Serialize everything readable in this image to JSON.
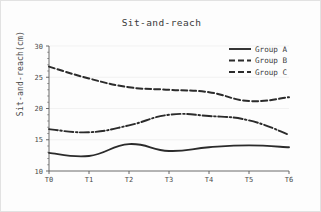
{
  "chart_data": {
    "type": "line",
    "title": "Sit-and-reach",
    "xlabel": "",
    "ylabel": "Sit-and-reach(cm)",
    "categories": [
      "T0",
      "T1",
      "T2",
      "T3",
      "T4",
      "T5",
      "T6"
    ],
    "ylim": [
      10,
      30
    ],
    "yticks": [
      10,
      15,
      20,
      25,
      30
    ],
    "grid": false,
    "legend_position": "top-right",
    "series": [
      {
        "name": "Group A",
        "style": "solid",
        "color": "#2b2b2b",
        "values": [
          12.9,
          12.4,
          14.3,
          13.2,
          13.8,
          14.1,
          13.8
        ]
      },
      {
        "name": "Group B",
        "style": "dash-dot",
        "color": "#2b2b2b",
        "values": [
          16.7,
          16.2,
          17.3,
          19.0,
          18.8,
          18.1,
          15.8
        ]
      },
      {
        "name": "Group C",
        "style": "dashed",
        "color": "#2b2b2b",
        "values": [
          26.7,
          24.8,
          23.4,
          23.0,
          22.6,
          21.2,
          21.8
        ]
      }
    ]
  },
  "legend": {
    "items": [
      {
        "label": "Group A"
      },
      {
        "label": "Group B"
      },
      {
        "label": "Group C"
      }
    ]
  }
}
